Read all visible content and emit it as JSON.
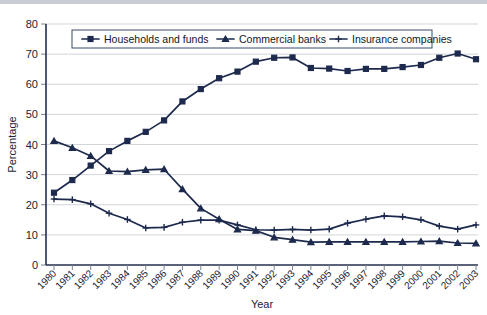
{
  "chart_data": {
    "type": "line",
    "title": "",
    "xlabel": "Year",
    "ylabel": "Percentage",
    "ylim": [
      0,
      80
    ],
    "yticks": [
      0,
      10,
      20,
      30,
      40,
      50,
      60,
      70,
      80
    ],
    "grid": true,
    "legend_position": "top-inside",
    "categories": [
      "1980",
      "1981",
      "1982",
      "1983",
      "1984",
      "1985",
      "1986",
      "1987",
      "1988",
      "1989",
      "1990",
      "1991",
      "1992",
      "1993",
      "1994",
      "1995",
      "1996",
      "1997",
      "1998",
      "1999",
      "2000",
      "2001",
      "2002",
      "2003"
    ],
    "series": [
      {
        "name": "Households and funds",
        "marker": "square",
        "color": "#1d2a4d",
        "values": [
          24.0,
          28.2,
          33.0,
          37.8,
          41.2,
          44.2,
          48.0,
          54.3,
          58.4,
          62.0,
          64.2,
          67.5,
          68.8,
          68.9,
          65.4,
          65.2,
          64.4,
          65.1,
          65.1,
          65.7,
          66.4,
          68.8,
          70.2,
          68.3
        ]
      },
      {
        "name": "Commercial banks",
        "marker": "triangle",
        "color": "#1d2a4d",
        "values": [
          41.2,
          38.9,
          36.2,
          31.2,
          31.0,
          31.6,
          31.8,
          25.2,
          18.8,
          15.2,
          11.8,
          11.4,
          9.2,
          8.4,
          7.6,
          7.7,
          7.7,
          7.7,
          7.7,
          7.7,
          7.8,
          7.9,
          7.3,
          7.2
        ]
      },
      {
        "name": "Insurance companies",
        "marker": "cross",
        "color": "#1d2a4d",
        "values": [
          21.9,
          21.7,
          20.3,
          17.2,
          15.1,
          12.3,
          12.5,
          14.2,
          14.9,
          14.9,
          13.3,
          11.7,
          11.6,
          11.8,
          11.6,
          11.9,
          13.9,
          15.2,
          16.3,
          16.0,
          15.0,
          12.9,
          11.9,
          13.3
        ]
      }
    ]
  },
  "legend": {
    "items": [
      {
        "label": "Households and funds"
      },
      {
        "label": "Commercial banks"
      },
      {
        "label": "Insurance companies"
      }
    ]
  }
}
